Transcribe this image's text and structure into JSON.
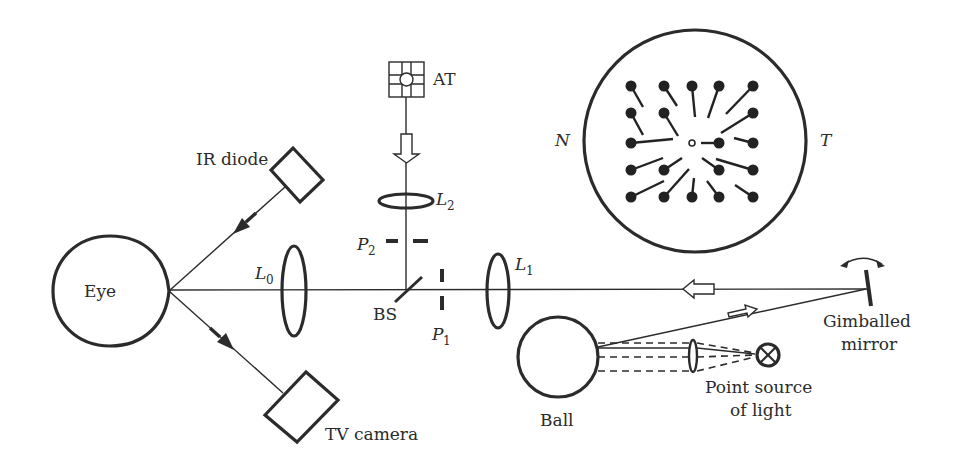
{
  "diagram": {
    "labels": {
      "eye": "Eye",
      "ir_diode": "IR diode",
      "tv_camera": "TV camera",
      "lens_l0": "L",
      "lens_l0_sub": "0",
      "lens_l1": "L",
      "lens_l1_sub": "1",
      "lens_l2": "L",
      "lens_l2_sub": "2",
      "pupil_p1": "P",
      "pupil_p1_sub": "1",
      "pupil_p2": "P",
      "pupil_p2_sub": "2",
      "beam_splitter": "BS",
      "at": "AT",
      "ball": "Ball",
      "point_source_line1": "Point source",
      "point_source_line2": "of light",
      "mirror_line1": "Gimballed",
      "mirror_line2": "mirror",
      "nasal": "N",
      "temporal": "T"
    },
    "colors": {
      "ink": "#2b2b2b",
      "background": "#ffffff"
    }
  }
}
